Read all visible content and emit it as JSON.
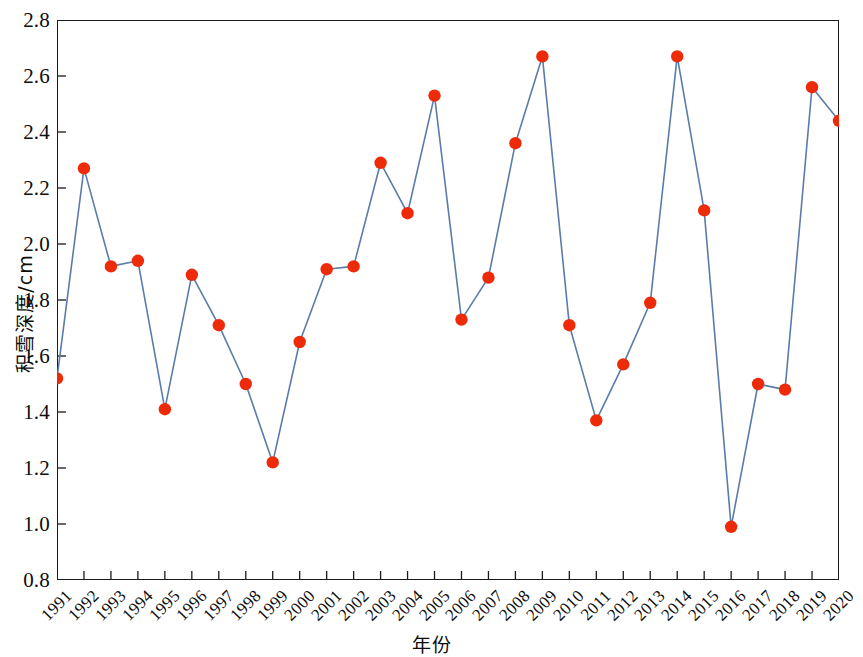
{
  "chart_data": {
    "type": "line",
    "title": "",
    "xlabel": "年份",
    "ylabel": "积雪深度/cm",
    "xlim": [
      1991,
      2020
    ],
    "ylim": [
      0.8,
      2.8
    ],
    "ytick_step": 0.2,
    "grid": false,
    "legend": null,
    "line_color": "#5a7ca8",
    "marker_color": "#ee2b09",
    "axis_color": "#1a1a1a",
    "marker": "circle",
    "categories": [
      "1991",
      "1992",
      "1993",
      "1994",
      "1995",
      "1996",
      "1997",
      "1998",
      "1999",
      "2000",
      "2001",
      "2002",
      "2003",
      "2004",
      "2005",
      "2006",
      "2007",
      "2008",
      "2009",
      "2010",
      "2011",
      "2012",
      "2013",
      "2014",
      "2015",
      "2016",
      "2017",
      "2018",
      "2019",
      "2020"
    ],
    "values": [
      1.52,
      2.27,
      1.92,
      1.94,
      1.41,
      1.89,
      1.71,
      1.5,
      1.22,
      1.65,
      1.91,
      1.92,
      2.29,
      2.11,
      2.53,
      1.73,
      1.88,
      2.36,
      2.67,
      1.71,
      1.37,
      1.57,
      1.79,
      2.67,
      2.12,
      0.99,
      1.5,
      1.48,
      2.56,
      2.44
    ],
    "ytick_labels": [
      "0.8",
      "1.0",
      "1.2",
      "1.4",
      "1.6",
      "1.8",
      "2.0",
      "2.2",
      "2.4",
      "2.6",
      "2.8"
    ],
    "ytick_values": [
      0.8,
      1.0,
      1.2,
      1.4,
      1.6,
      1.8,
      2.0,
      2.2,
      2.4,
      2.6,
      2.8
    ]
  }
}
